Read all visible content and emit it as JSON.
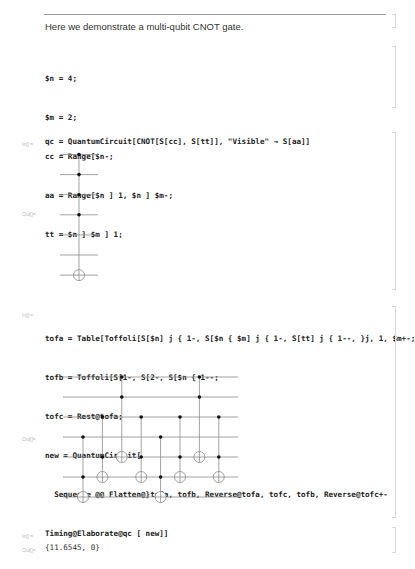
{
  "text_cell": "Here we demonstrate a multi-qubit CNOT gate.",
  "init_cell": {
    "lines": [
      "$n = 4;",
      "$m = 2;",
      "cc = Range[$n-;",
      "aa = Range[$n ] 1, $n ] $m-;",
      "tt = $n ] $m ] 1;"
    ]
  },
  "cell1": {
    "in_label": "In[]:=",
    "input": "qc = QuantumCircuit[CNOT[S[cc], S[tt]], \"Visible\" → S[aa]]",
    "out_label": "Out[]=",
    "circuit": {
      "wires": 7,
      "gates": [
        {
          "controls": [
            1,
            2,
            3,
            4
          ],
          "target": 7
        }
      ]
    }
  },
  "cell2": {
    "in_label": "In[]:=",
    "lines": [
      "tofa = Table[Toffoli[S[$n] j { 1-, S[$n { $m] j { 1-, S[tt] j { 1--, }j, 1, $m+-;",
      "tofb = Toffoli[S[1-, S[2-, S[$n { 1--;",
      "tofc = Rest@tofa;",
      "new = QuantumCircuit[",
      "  Sequence @@ Flatten@}tofa, tofb, Reverse@tofa, tofc, tofb, Reverse@tofc+-"
    ],
    "out_label": "Out[]=",
    "circuit": {
      "wires": 7,
      "gates": [
        {
          "controls": [
            4,
            6
          ],
          "target": 7
        },
        {
          "controls": [
            3,
            5
          ],
          "target": 6
        },
        {
          "controls": [
            1,
            2
          ],
          "target": 5
        },
        {
          "controls": [
            3,
            5
          ],
          "target": 6
        },
        {
          "controls": [
            4,
            6
          ],
          "target": 7
        },
        {
          "controls": [
            3,
            5
          ],
          "target": 6
        },
        {
          "controls": [
            1,
            2
          ],
          "target": 5
        },
        {
          "controls": [
            3,
            5
          ],
          "target": 6
        }
      ]
    }
  },
  "cell3": {
    "in_label": "In[]:=",
    "input": "Timing@Elaborate@qc [ new]]",
    "out_label": "Out[]=",
    "output": "{11.6545, 0}"
  }
}
